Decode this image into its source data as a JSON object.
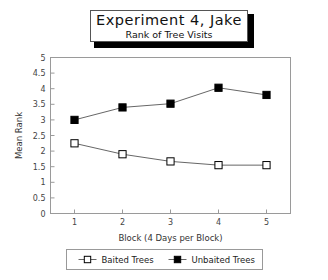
{
  "title": {
    "main": "Experiment 4, Jake",
    "subtitle": "Rank of Tree Visits"
  },
  "chart_data": {
    "type": "line",
    "title": "Experiment 4, Jake",
    "subtitle": "Rank of Tree Visits",
    "xlabel": "Block (4 Days per Block)",
    "ylabel": "Mean Rank",
    "x": [
      1,
      2,
      3,
      4,
      5
    ],
    "categories": [
      "1",
      "2",
      "3",
      "4",
      "5"
    ],
    "xlim": [
      0.5,
      5.5
    ],
    "ylim": [
      0,
      5
    ],
    "yticks": [
      0,
      0.5,
      1,
      1.5,
      2,
      2.5,
      3,
      3.5,
      4,
      4.5,
      5
    ],
    "ytick_labels": [
      "0",
      "0.5",
      "1",
      "1.5",
      "2",
      "2.5",
      "3",
      "3.5",
      "4",
      "4.5",
      "5"
    ],
    "xticks": [
      1,
      2,
      3,
      4,
      5
    ],
    "xtick_labels": [
      "1",
      "2",
      "3",
      "4",
      "5"
    ],
    "grid": false,
    "legend_position": "below",
    "series": [
      {
        "name": "Baited Trees",
        "marker": "open-square",
        "color": "#000000",
        "fill": "#ffffff",
        "values": [
          2.25,
          1.9,
          1.67,
          1.55,
          1.55
        ]
      },
      {
        "name": "Unbaited Trees",
        "marker": "filled-square",
        "color": "#000000",
        "fill": "#000000",
        "values": [
          3.0,
          3.4,
          3.52,
          4.03,
          3.8
        ]
      }
    ]
  },
  "legend": {
    "items": [
      {
        "label": "Baited Trees"
      },
      {
        "label": "Unbaited Trees"
      }
    ]
  },
  "colors": {
    "frame": "#9a9a9a",
    "line": "#555555",
    "text": "#222222",
    "background": "#ffffff"
  }
}
